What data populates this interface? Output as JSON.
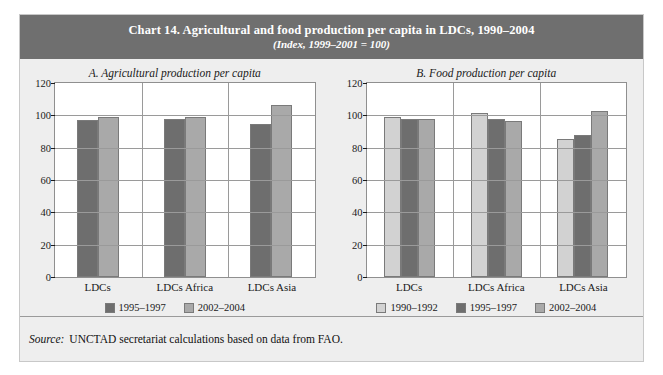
{
  "figure": {
    "title": "Chart 14. Agricultural and food production per capita in LDCs, 1990–2004",
    "subtitle": "(Index, 1999–2001 = 100)",
    "source_label": "Source:",
    "source_text": "UNCTAD secretariat calculations based on data from FAO."
  },
  "colors": {
    "header_bg": "#6f6f6f",
    "panel_bg": "#eeeeee",
    "plot_bg": "#ffffff",
    "series_1990_1992": "#d2d2d2",
    "series_1995_1997": "#6e6e6e",
    "series_2002_2004": "#a9a9a9",
    "grid": "#9a9a9a"
  },
  "chart_data": [
    {
      "type": "bar",
      "title": "A.  Agricultural production per capita",
      "categories": [
        "LDCs",
        "LDCs Africa",
        "LDCs Asia"
      ],
      "series": [
        {
          "name": "1995–1997",
          "color": "#6e6e6e",
          "values": [
            97,
            98,
            94.5
          ]
        },
        {
          "name": "2002–2004",
          "color": "#a9a9a9",
          "values": [
            99,
            99,
            106.5
          ]
        }
      ],
      "xlabel": "",
      "ylabel": "",
      "ylim": [
        0,
        120
      ],
      "yticks": [
        0,
        20,
        40,
        60,
        80,
        100,
        120
      ],
      "grid": true,
      "legend_position": "bottom"
    },
    {
      "type": "bar",
      "title": "B.  Food production per capita",
      "categories": [
        "LDCs",
        "LDCs Africa",
        "LDCs Asia"
      ],
      "series": [
        {
          "name": "1990–1992",
          "color": "#d2d2d2",
          "values": [
            99,
            101.5,
            85.5
          ]
        },
        {
          "name": "1995–1997",
          "color": "#6e6e6e",
          "values": [
            97.5,
            98,
            88
          ]
        },
        {
          "name": "2002–2004",
          "color": "#a9a9a9",
          "values": [
            98,
            96.5,
            102.5
          ]
        }
      ],
      "xlabel": "",
      "ylabel": "",
      "ylim": [
        0,
        120
      ],
      "yticks": [
        0,
        20,
        40,
        60,
        80,
        100,
        120
      ],
      "grid": true,
      "legend_position": "bottom"
    }
  ]
}
